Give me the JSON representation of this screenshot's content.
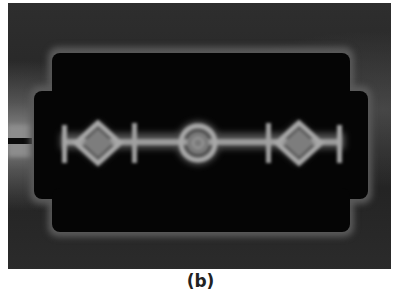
{
  "figure": {
    "panel_label": "(b)",
    "colors": {
      "background": "#262626",
      "cavity": "#050505",
      "highlight": "#9a9a9a",
      "caption_text": "#222222"
    },
    "elements": {
      "feed_line": "left side feed line",
      "diamonds": 2,
      "circle": 1,
      "cross_bars": 4,
      "end_bars": 2
    }
  }
}
